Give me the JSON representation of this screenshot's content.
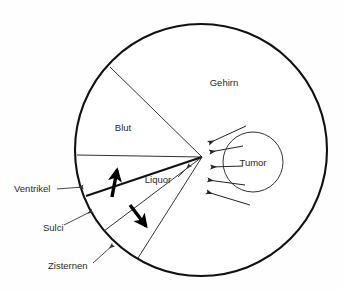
{
  "diagram": {
    "background_color": "#fefefe",
    "line_color": "#111111",
    "text_color": "#2a2a2a",
    "outer_circle": {
      "name": "Gehirn (Schädelinnenraum)",
      "cx": 201,
      "cy": 150,
      "r": 126
    },
    "tumor_circle": {
      "name": "Tumor",
      "cx": 253,
      "cy": 162,
      "r": 30
    },
    "convergence_point": {
      "x": 202,
      "y": 157
    },
    "labels": {
      "gehirn": {
        "text": "Gehirn",
        "x": 224,
        "y": 83
      },
      "blut": {
        "text": "Blut",
        "x": 123,
        "y": 128
      },
      "liquor": {
        "text": "Liquor",
        "x": 158,
        "y": 180
      },
      "tumor": {
        "text": "Tumor",
        "x": 253,
        "y": 163
      },
      "ventrikel": {
        "text": "Ventrikel",
        "x": 14,
        "y": 189
      },
      "sulci": {
        "text": "Sulci",
        "x": 43,
        "y": 228
      },
      "zisternen": {
        "text": "Zisternen",
        "x": 48,
        "y": 266
      }
    },
    "wedges": [
      {
        "name": "blut-wedge-upper-boundary",
        "from_x": 202,
        "from_y": 157,
        "to_x": 110,
        "to_y": 67
      },
      {
        "name": "blut-wedge-lower-boundary",
        "from_x": 202,
        "from_y": 157,
        "to_x": 77,
        "to_y": 155
      },
      {
        "name": "ventrikel-boundary",
        "from_x": 202,
        "from_y": 157,
        "to_x": 86,
        "to_y": 196,
        "bold": true
      },
      {
        "name": "sulci-boundary",
        "from_x": 202,
        "from_y": 157,
        "to_x": 104,
        "to_y": 231
      },
      {
        "name": "zisternen-boundary",
        "from_x": 202,
        "from_y": 157,
        "to_x": 138,
        "to_y": 258
      }
    ],
    "flow_arrows": [
      {
        "name": "tumor-arrow-1",
        "from_x": 246,
        "from_y": 126,
        "to_x": 209,
        "to_y": 143
      },
      {
        "name": "tumor-arrow-2",
        "from_x": 243,
        "from_y": 146,
        "to_x": 210,
        "to_y": 152
      },
      {
        "name": "tumor-arrow-3",
        "from_x": 243,
        "from_y": 166,
        "to_x": 211,
        "to_y": 167
      },
      {
        "name": "tumor-arrow-4",
        "from_x": 245,
        "from_y": 185,
        "to_x": 208,
        "to_y": 180
      },
      {
        "name": "tumor-arrow-5",
        "from_x": 250,
        "from_y": 205,
        "to_x": 207,
        "to_y": 192
      }
    ],
    "bold_arrows": [
      {
        "name": "ventrikel-flow-arrow",
        "from_x": 112,
        "from_y": 197,
        "to_x": 117,
        "to_y": 170
      },
      {
        "name": "sulci-flow-arrow",
        "from_x": 130,
        "from_y": 205,
        "to_x": 146,
        "to_y": 226
      }
    ],
    "leaders": [
      {
        "name": "ventrikel-leader",
        "from_x": 57,
        "from_y": 189,
        "to_x": 83,
        "to_y": 187
      },
      {
        "name": "sulci-leader",
        "from_x": 64,
        "from_y": 225,
        "to_x": 92,
        "to_y": 211
      },
      {
        "name": "zisternen-leader",
        "from_x": 93,
        "from_y": 263,
        "to_x": 113,
        "to_y": 245
      },
      {
        "name": "liquor-leader",
        "from_x": 178,
        "from_y": 177,
        "to_x": 190,
        "to_y": 165
      }
    ]
  }
}
